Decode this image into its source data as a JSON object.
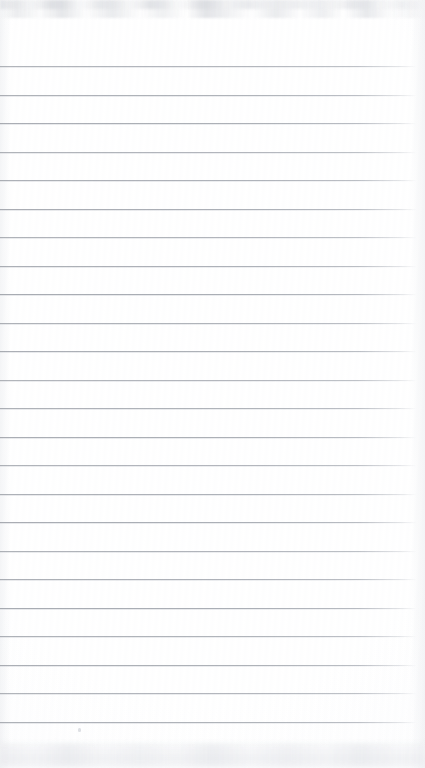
{
  "document": {
    "kind": "scanned-ruled-paper",
    "title": "Blank Ruled Notepad Page",
    "orientation": "portrait",
    "page_width_px": 425,
    "page_height_px": 768,
    "has_handwriting": false,
    "has_printed_text": false,
    "visible_text": "",
    "margin_note": "No header, no margin rule, no page number visible"
  },
  "paper": {
    "background_color": "#ffffff",
    "tint_color": "#fafafb",
    "top_margin_px": 66,
    "bottom_margin_px": 30,
    "left_inset_px": 0,
    "right_inset_px": 9
  },
  "ruling": {
    "line_color": "#aaaeb5",
    "line_halo_color": "#ced1d6",
    "line_thickness_px": 1,
    "line_count": 24,
    "first_line_y": 66,
    "spacing_px": 28.5,
    "line_start_x": 0,
    "line_end_x": 416,
    "style": "horizontal-rules-only",
    "line_y_positions": [
      66,
      94.5,
      123,
      151.5,
      180,
      208.5,
      237,
      265.5,
      294,
      322.5,
      351,
      379.5,
      408,
      436.5,
      465,
      493.5,
      522,
      550.5,
      579,
      607.5,
      636,
      664.5,
      693,
      721.5
    ]
  },
  "artifacts": {
    "scan_noise_top": true,
    "scan_noise_bottom": true,
    "dust_specks": [
      {
        "x": 78,
        "y": 728
      }
    ]
  }
}
